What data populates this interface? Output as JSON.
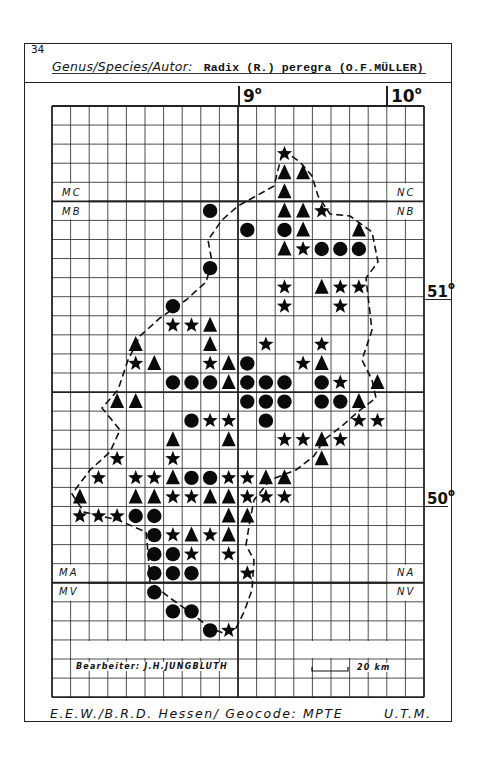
{
  "page_number": "34",
  "header": {
    "label": "Genus/Species/Autor:",
    "species": "Radix (R.) peregra (O.F.MÜLLER)"
  },
  "longitude_labels": [
    {
      "id": "lon9",
      "text": "9",
      "unit": "o"
    },
    {
      "id": "lon10",
      "text": "10",
      "unit": "o"
    }
  ],
  "latitude_labels": [
    {
      "id": "lat51",
      "text": "51",
      "unit": "o"
    },
    {
      "id": "lat50",
      "text": "50",
      "unit": "o"
    }
  ],
  "zone_labels": {
    "mc": "MC",
    "mb": "MB",
    "nc": "NC",
    "nb": "NB",
    "ma": "MA",
    "mv": "MV",
    "na": "NA",
    "nv": "NV"
  },
  "legend": {
    "author": "Bearbeiter: J.H.JUNGBLUTH",
    "scale_label": "20 km"
  },
  "footer": {
    "left": "E.E.W./B.R.D. Hessen/ Geocode: MPTE",
    "right": "U.T.M."
  },
  "grid": {
    "columns": 20,
    "rows": 31,
    "origin_x": 52,
    "origin_y": 106,
    "cell_w": 18.6,
    "cell_h": 19.07
  },
  "symbol_types": {
    "circle": "filled-circle",
    "triangle": "filled-triangle",
    "star": "filled-star"
  },
  "records": [
    {
      "r": 2,
      "c": 12,
      "s": "star"
    },
    {
      "r": 3,
      "c": 12,
      "s": "triangle"
    },
    {
      "r": 3,
      "c": 13,
      "s": "triangle"
    },
    {
      "r": 4,
      "c": 12,
      "s": "triangle"
    },
    {
      "r": 5,
      "c": 8,
      "s": "circle"
    },
    {
      "r": 5,
      "c": 12,
      "s": "triangle"
    },
    {
      "r": 5,
      "c": 13,
      "s": "triangle"
    },
    {
      "r": 5,
      "c": 14,
      "s": "star"
    },
    {
      "r": 6,
      "c": 10,
      "s": "circle"
    },
    {
      "r": 6,
      "c": 12,
      "s": "circle"
    },
    {
      "r": 6,
      "c": 13,
      "s": "triangle"
    },
    {
      "r": 6,
      "c": 16,
      "s": "triangle"
    },
    {
      "r": 7,
      "c": 12,
      "s": "triangle"
    },
    {
      "r": 7,
      "c": 13,
      "s": "star"
    },
    {
      "r": 7,
      "c": 14,
      "s": "circle"
    },
    {
      "r": 7,
      "c": 15,
      "s": "circle"
    },
    {
      "r": 7,
      "c": 16,
      "s": "circle"
    },
    {
      "r": 8,
      "c": 8,
      "s": "circle"
    },
    {
      "r": 9,
      "c": 12,
      "s": "star"
    },
    {
      "r": 9,
      "c": 14,
      "s": "triangle"
    },
    {
      "r": 9,
      "c": 15,
      "s": "star"
    },
    {
      "r": 9,
      "c": 16,
      "s": "star"
    },
    {
      "r": 10,
      "c": 6,
      "s": "circle"
    },
    {
      "r": 10,
      "c": 12,
      "s": "star"
    },
    {
      "r": 10,
      "c": 15,
      "s": "star"
    },
    {
      "r": 11,
      "c": 6,
      "s": "star"
    },
    {
      "r": 11,
      "c": 7,
      "s": "star"
    },
    {
      "r": 11,
      "c": 8,
      "s": "triangle"
    },
    {
      "r": 12,
      "c": 4,
      "s": "triangle"
    },
    {
      "r": 12,
      "c": 8,
      "s": "triangle"
    },
    {
      "r": 12,
      "c": 11,
      "s": "star"
    },
    {
      "r": 12,
      "c": 14,
      "s": "star"
    },
    {
      "r": 13,
      "c": 4,
      "s": "star"
    },
    {
      "r": 13,
      "c": 5,
      "s": "triangle"
    },
    {
      "r": 13,
      "c": 8,
      "s": "star"
    },
    {
      "r": 13,
      "c": 9,
      "s": "triangle"
    },
    {
      "r": 13,
      "c": 10,
      "s": "circle"
    },
    {
      "r": 13,
      "c": 13,
      "s": "star"
    },
    {
      "r": 13,
      "c": 14,
      "s": "triangle"
    },
    {
      "r": 14,
      "c": 6,
      "s": "circle"
    },
    {
      "r": 14,
      "c": 7,
      "s": "circle"
    },
    {
      "r": 14,
      "c": 8,
      "s": "circle"
    },
    {
      "r": 14,
      "c": 9,
      "s": "triangle"
    },
    {
      "r": 14,
      "c": 10,
      "s": "circle"
    },
    {
      "r": 14,
      "c": 11,
      "s": "circle"
    },
    {
      "r": 14,
      "c": 12,
      "s": "circle"
    },
    {
      "r": 14,
      "c": 14,
      "s": "circle"
    },
    {
      "r": 14,
      "c": 15,
      "s": "star"
    },
    {
      "r": 14,
      "c": 17,
      "s": "triangle"
    },
    {
      "r": 15,
      "c": 3,
      "s": "triangle"
    },
    {
      "r": 15,
      "c": 4,
      "s": "triangle"
    },
    {
      "r": 15,
      "c": 10,
      "s": "circle"
    },
    {
      "r": 15,
      "c": 11,
      "s": "circle"
    },
    {
      "r": 15,
      "c": 12,
      "s": "circle"
    },
    {
      "r": 15,
      "c": 14,
      "s": "circle"
    },
    {
      "r": 15,
      "c": 15,
      "s": "circle"
    },
    {
      "r": 15,
      "c": 16,
      "s": "triangle"
    },
    {
      "r": 16,
      "c": 7,
      "s": "circle"
    },
    {
      "r": 16,
      "c": 8,
      "s": "star"
    },
    {
      "r": 16,
      "c": 9,
      "s": "star"
    },
    {
      "r": 16,
      "c": 11,
      "s": "circle"
    },
    {
      "r": 16,
      "c": 16,
      "s": "star"
    },
    {
      "r": 16,
      "c": 17,
      "s": "star"
    },
    {
      "r": 17,
      "c": 6,
      "s": "triangle"
    },
    {
      "r": 17,
      "c": 9,
      "s": "triangle"
    },
    {
      "r": 17,
      "c": 12,
      "s": "star"
    },
    {
      "r": 17,
      "c": 13,
      "s": "star"
    },
    {
      "r": 17,
      "c": 14,
      "s": "triangle"
    },
    {
      "r": 17,
      "c": 15,
      "s": "star"
    },
    {
      "r": 18,
      "c": 3,
      "s": "star"
    },
    {
      "r": 18,
      "c": 6,
      "s": "star"
    },
    {
      "r": 18,
      "c": 14,
      "s": "triangle"
    },
    {
      "r": 19,
      "c": 2,
      "s": "star"
    },
    {
      "r": 19,
      "c": 4,
      "s": "star"
    },
    {
      "r": 19,
      "c": 5,
      "s": "star"
    },
    {
      "r": 19,
      "c": 6,
      "s": "triangle"
    },
    {
      "r": 19,
      "c": 7,
      "s": "circle"
    },
    {
      "r": 19,
      "c": 8,
      "s": "circle"
    },
    {
      "r": 19,
      "c": 9,
      "s": "star"
    },
    {
      "r": 19,
      "c": 10,
      "s": "star"
    },
    {
      "r": 19,
      "c": 11,
      "s": "triangle"
    },
    {
      "r": 19,
      "c": 12,
      "s": "triangle"
    },
    {
      "r": 20,
      "c": 1,
      "s": "triangle"
    },
    {
      "r": 20,
      "c": 4,
      "s": "triangle"
    },
    {
      "r": 20,
      "c": 5,
      "s": "triangle"
    },
    {
      "r": 20,
      "c": 6,
      "s": "star"
    },
    {
      "r": 20,
      "c": 7,
      "s": "star"
    },
    {
      "r": 20,
      "c": 8,
      "s": "triangle"
    },
    {
      "r": 20,
      "c": 9,
      "s": "triangle"
    },
    {
      "r": 20,
      "c": 10,
      "s": "star"
    },
    {
      "r": 20,
      "c": 11,
      "s": "star"
    },
    {
      "r": 20,
      "c": 12,
      "s": "star"
    },
    {
      "r": 21,
      "c": 1,
      "s": "star"
    },
    {
      "r": 21,
      "c": 2,
      "s": "star"
    },
    {
      "r": 21,
      "c": 3,
      "s": "star"
    },
    {
      "r": 21,
      "c": 4,
      "s": "circle"
    },
    {
      "r": 21,
      "c": 5,
      "s": "circle"
    },
    {
      "r": 21,
      "c": 9,
      "s": "triangle"
    },
    {
      "r": 21,
      "c": 10,
      "s": "triangle"
    },
    {
      "r": 22,
      "c": 5,
      "s": "circle"
    },
    {
      "r": 22,
      "c": 6,
      "s": "star"
    },
    {
      "r": 22,
      "c": 7,
      "s": "triangle"
    },
    {
      "r": 22,
      "c": 8,
      "s": "star"
    },
    {
      "r": 22,
      "c": 9,
      "s": "triangle"
    },
    {
      "r": 23,
      "c": 5,
      "s": "circle"
    },
    {
      "r": 23,
      "c": 6,
      "s": "circle"
    },
    {
      "r": 23,
      "c": 7,
      "s": "star"
    },
    {
      "r": 23,
      "c": 9,
      "s": "star"
    },
    {
      "r": 24,
      "c": 5,
      "s": "circle"
    },
    {
      "r": 24,
      "c": 6,
      "s": "circle"
    },
    {
      "r": 24,
      "c": 7,
      "s": "circle"
    },
    {
      "r": 24,
      "c": 10,
      "s": "star"
    },
    {
      "r": 25,
      "c": 5,
      "s": "circle"
    },
    {
      "r": 26,
      "c": 6,
      "s": "circle"
    },
    {
      "r": 26,
      "c": 7,
      "s": "circle"
    },
    {
      "r": 27,
      "c": 8,
      "s": "circle"
    },
    {
      "r": 27,
      "c": 9,
      "s": "star"
    }
  ]
}
